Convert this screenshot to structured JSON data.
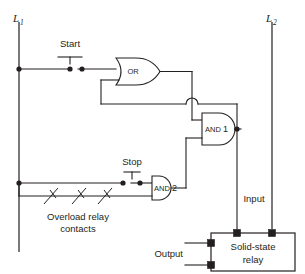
{
  "diagram": {
    "type": "electrical-logic-schematic",
    "colors": {
      "line": "#231f20",
      "background": "#ffffff",
      "fill": "#ffffff"
    },
    "rails": {
      "left_label": "L",
      "left_subscript": "1",
      "right_label": "L",
      "right_subscript": "2"
    },
    "controls": {
      "start_label": "Start",
      "stop_label": "Stop"
    },
    "gates": {
      "or_label": "OR",
      "and1_label": "AND",
      "and1_number": "1",
      "and2_label": "AND",
      "and2_number": "2"
    },
    "overload": {
      "line1": "Overload relay",
      "line2": "contacts",
      "contact_count": 3
    },
    "relay": {
      "name_line1": "Solid-state",
      "name_line2": "relay",
      "input_label": "Input",
      "output_label": "Output"
    }
  }
}
